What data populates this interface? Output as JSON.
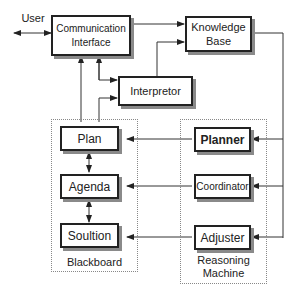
{
  "diagram": {
    "external": {
      "user": "User"
    },
    "nodes": {
      "communication_interface": {
        "line1": "Communication",
        "line2": "Interface"
      },
      "knowledge_base": {
        "line1": "Knowledge",
        "line2": "Base"
      },
      "interpretor": "Interpretor",
      "plan": "Plan",
      "agenda": "Agenda",
      "solution": "Soultion",
      "planner": "Planner",
      "coordinator": "Coordinator",
      "adjuster": "Adjuster"
    },
    "groups": {
      "blackboard": "Blackboard",
      "reasoning_machine": {
        "line1": "Reasoning",
        "line2": "Machine"
      }
    },
    "edges": [
      {
        "from": "user",
        "to": "communication_interface",
        "type": "bidirectional"
      },
      {
        "from": "communication_interface",
        "to": "knowledge_base"
      },
      {
        "from": "interpretor",
        "to": "knowledge_base"
      },
      {
        "from": "communication_interface",
        "to": "interpretor"
      },
      {
        "from": "plan",
        "to": "interpretor"
      },
      {
        "from": "plan",
        "to": "communication_interface"
      },
      {
        "from": "knowledge_base",
        "to": "planner"
      },
      {
        "from": "knowledge_base",
        "to": "coordinator"
      },
      {
        "from": "knowledge_base",
        "to": "adjuster"
      },
      {
        "from": "planner",
        "to": "plan"
      },
      {
        "from": "coordinator",
        "to": "agenda"
      },
      {
        "from": "adjuster",
        "to": "solution"
      },
      {
        "from": "plan",
        "to": "agenda",
        "type": "bidirectional"
      },
      {
        "from": "agenda",
        "to": "solution",
        "type": "bidirectional"
      }
    ]
  }
}
